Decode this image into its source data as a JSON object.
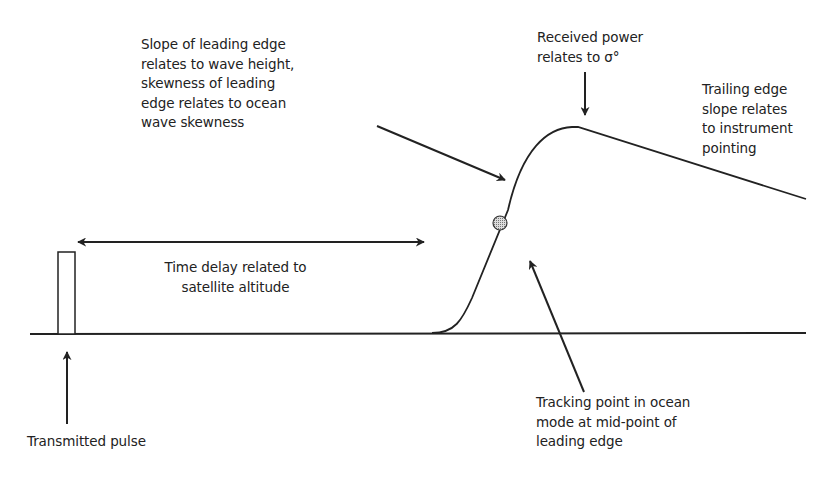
{
  "diagram": {
    "type": "radar altimeter return waveform",
    "colors": {
      "line": "#222222",
      "background": "#ffffff",
      "tracking_point_fill": "#bbbbbb"
    },
    "labels": {
      "leading_edge": [
        "Slope of leading edge",
        "relates to wave height,",
        "skewness of leading",
        "edge relates to ocean",
        "wave skewness"
      ],
      "received_power": [
        "Received power",
        "relates to σ°"
      ],
      "trailing_edge": [
        "Trailing edge",
        "slope relates",
        "to instrument",
        "pointing"
      ],
      "time_delay": [
        "Time delay related to",
        "satellite altitude"
      ],
      "transmitted_pulse": [
        "Transmitted pulse"
      ],
      "tracking_point": [
        "Tracking point in ocean",
        "mode at mid-point of",
        "leading edge"
      ]
    },
    "elements": {
      "baseline": "horizontal time axis",
      "pulse": "transmitted rectangular pulse",
      "waveform": "received echo waveform with leading edge, peak and trailing edge",
      "tracking_point": "mid-point marker on leading edge"
    }
  }
}
